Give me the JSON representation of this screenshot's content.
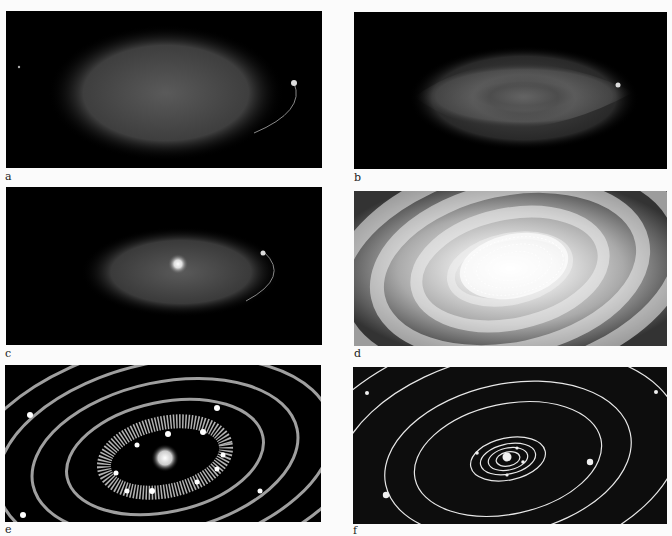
{
  "figure": {
    "panels": [
      {
        "id": "a",
        "label": "a",
        "description": "diffuse rotating cloud"
      },
      {
        "id": "b",
        "label": "b",
        "description": "flattening cloud"
      },
      {
        "id": "c",
        "label": "c",
        "description": "central bright core forming"
      },
      {
        "id": "d",
        "label": "d",
        "description": "swirling protoplanetary disk"
      },
      {
        "id": "e",
        "label": "e",
        "description": "rings with clumping planetesimals"
      },
      {
        "id": "f",
        "label": "f",
        "description": "planets on elliptical orbits"
      }
    ]
  },
  "colors": {
    "background": "#fbfbfb",
    "panel": "#000000",
    "glow": "#cfcfcf",
    "orbit": "#e8e8e8"
  }
}
